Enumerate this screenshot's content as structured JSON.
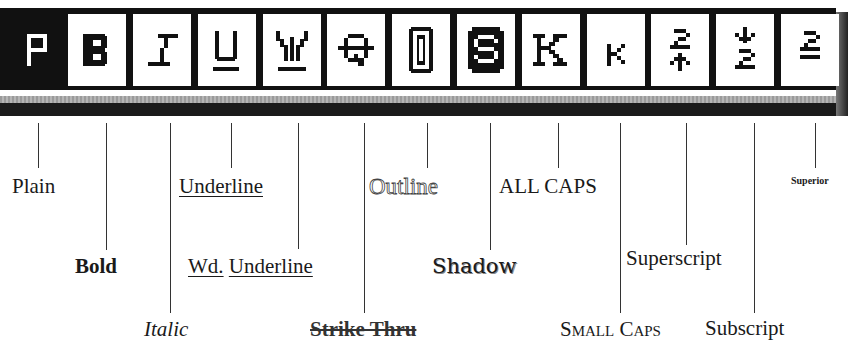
{
  "toolbar": {
    "buttons": [
      {
        "name": "plain",
        "glyph": "P",
        "selected": true,
        "x": 9
      },
      {
        "name": "bold",
        "glyph": "B",
        "selected": false,
        "x": 68
      },
      {
        "name": "italic",
        "glyph": "I",
        "selected": false,
        "x": 133
      },
      {
        "name": "underline",
        "glyph": "U",
        "selected": false,
        "x": 198
      },
      {
        "name": "word-underline",
        "glyph": "W",
        "selected": false,
        "x": 263
      },
      {
        "name": "strike-thru",
        "glyph": "Q",
        "selected": false,
        "x": 327
      },
      {
        "name": "outline",
        "glyph": "O",
        "selected": false,
        "x": 392
      },
      {
        "name": "shadow",
        "glyph": "S",
        "selected": false,
        "x": 457
      },
      {
        "name": "all-caps",
        "glyph": "K",
        "selected": false,
        "x": 522
      },
      {
        "name": "small-caps",
        "glyph": "k",
        "selected": false,
        "x": 587
      },
      {
        "name": "superscript",
        "glyph": "2↑",
        "selected": false,
        "x": 651
      },
      {
        "name": "subscript",
        "glyph": "↓2",
        "selected": false,
        "x": 716
      },
      {
        "name": "superior",
        "glyph": "2̲",
        "selected": false,
        "x": 781
      }
    ]
  },
  "labels": {
    "plain": "Plain",
    "bold": "Bold",
    "italic": "Italic",
    "underline": "Underline",
    "wd": "Wd.",
    "wd_underline": "Underline",
    "strike_thru": "Strike Thru",
    "outline": "Outline",
    "shadow": "Shadow",
    "all_caps": "ALL CAPS",
    "small_caps": "Small Caps",
    "superscript": "Superscript",
    "subscript": "Subscript",
    "superior": "Superior"
  }
}
